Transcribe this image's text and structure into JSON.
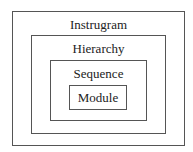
{
  "diagram": {
    "type": "nested-boxes",
    "levels": [
      {
        "label": "Instrugram"
      },
      {
        "label": "Hierarchy"
      },
      {
        "label": "Sequence"
      },
      {
        "label": "Module"
      }
    ]
  }
}
